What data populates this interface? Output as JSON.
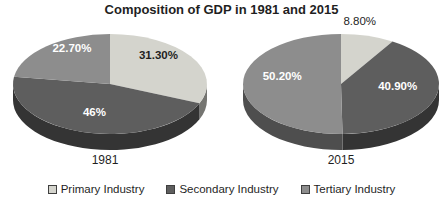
{
  "chart_data": {
    "type": "pie",
    "title": "Composition of GDP in 1981 and 2015",
    "legend_position": "bottom",
    "legend": [
      "Primary Industry",
      "Secondary Industry",
      "Tertiary Industry"
    ],
    "series_colors": [
      "#d4d4cd",
      "#5e5e5e",
      "#8d8d8d"
    ],
    "style": "3d-pie",
    "pies": [
      {
        "label": "1981",
        "slices": [
          {
            "name": "Primary Industry",
            "value": 31.3,
            "display": "31.30%",
            "color": "#d4d4cd",
            "label_placement": "inside"
          },
          {
            "name": "Secondary Industry",
            "value": 46.0,
            "display": "46%",
            "color": "#5e5e5e",
            "label_placement": "inside"
          },
          {
            "name": "Tertiary Industry",
            "value": 22.7,
            "display": "22.70%",
            "color": "#8d8d8d",
            "label_placement": "inside"
          }
        ]
      },
      {
        "label": "2015",
        "slices": [
          {
            "name": "Primary Industry",
            "value": 8.8,
            "display": "8.80%",
            "color": "#d4d4cd",
            "label_placement": "outside"
          },
          {
            "name": "Secondary Industry",
            "value": 40.9,
            "display": "40.90%",
            "color": "#5e5e5e",
            "label_placement": "inside"
          },
          {
            "name": "Tertiary Industry",
            "value": 50.2,
            "display": "50.20%",
            "color": "#8d8d8d",
            "label_placement": "inside"
          }
        ]
      }
    ]
  }
}
